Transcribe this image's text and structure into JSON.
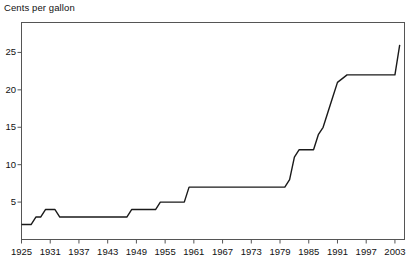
{
  "chart_data": {
    "type": "line",
    "title": "Cents per gallon",
    "xlabel": "",
    "ylabel": "Cents per gallon",
    "xlim": [
      1925,
      2005
    ],
    "ylim": [
      0,
      29
    ],
    "grid": false,
    "legend": "none",
    "line_color": "#1a1a1a",
    "background_color": "#ffffff",
    "axis_color": "#555555",
    "xticks": [
      1925,
      1931,
      1937,
      1943,
      1949,
      1955,
      1961,
      1967,
      1973,
      1979,
      1985,
      1991,
      1997,
      2003
    ],
    "yticks": [
      5,
      10,
      15,
      20,
      25
    ],
    "series": [
      {
        "name": "Federal gasoline tax",
        "x": [
          1925,
          1927,
          1928,
          1929,
          1930,
          1932,
          1933,
          1934,
          1947,
          1948,
          1953,
          1954,
          1959,
          1960,
          1980,
          1981,
          1982,
          1983,
          1986,
          1987,
          1988,
          1989,
          1990,
          1991,
          1993,
          1994,
          2003,
          2004
        ],
        "values": [
          2,
          2,
          3,
          3,
          4,
          4,
          3,
          3,
          3,
          4,
          4,
          5,
          5,
          7,
          7,
          8,
          11,
          12,
          12,
          14,
          15,
          17,
          19,
          21,
          22,
          22,
          22,
          26
        ]
      }
    ]
  }
}
